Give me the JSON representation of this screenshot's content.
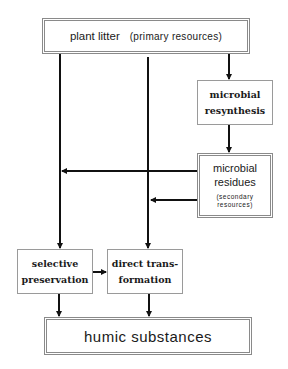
{
  "diagram": {
    "nodes": {
      "plant_litter": {
        "label": "plant litter",
        "sublabel": "(primary resources)"
      },
      "microbial_resynthesis": {
        "line1": "microbial",
        "line2": "resynthesis"
      },
      "microbial_residues": {
        "line1": "microbial",
        "line2": "residues",
        "sub1": "(secondary",
        "sub2": "resources)"
      },
      "selective_preservation": {
        "line1": "selective",
        "line2": "preservation"
      },
      "direct_transformation": {
        "line1": "direct trans-",
        "line2": "formation"
      },
      "humic_substances": {
        "label": "humic substances"
      }
    },
    "edges": [
      {
        "from": "plant_litter",
        "to": "microbial_resynthesis"
      },
      {
        "from": "microbial_resynthesis",
        "to": "microbial_residues"
      },
      {
        "from": "plant_litter",
        "to": "selective_preservation"
      },
      {
        "from": "plant_litter",
        "to": "direct_transformation"
      },
      {
        "from": "microbial_residues",
        "to": "selective_preservation"
      },
      {
        "from": "microbial_residues",
        "to": "direct_transformation"
      },
      {
        "from": "selective_preservation",
        "to": "direct_transformation"
      },
      {
        "from": "selective_preservation",
        "to": "humic_substances"
      },
      {
        "from": "direct_transformation",
        "to": "humic_substances"
      }
    ],
    "colors": {
      "line": "#111111",
      "border": "#8a8a8a"
    }
  }
}
